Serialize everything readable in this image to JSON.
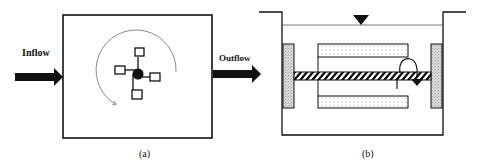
{
  "figure": {
    "panel_a": {
      "caption": "(a)",
      "inflow_label": "Inflow",
      "outflow_label": "Outflow",
      "rotation_direction": "counter-clockwise-arrow",
      "impeller": "four-blade-paddle-icon"
    },
    "panel_b": {
      "caption": "(b)",
      "water_level_marker": "inverted-triangle-icon",
      "components": [
        "tank",
        "end-plates",
        "rotating-shaft",
        "drum-upper",
        "drum-lower",
        "rotation-arrow"
      ]
    }
  },
  "colors": {
    "stroke": "#111111",
    "plate_fill": "#cfcfcf",
    "drum_dots": "#9a9a9a",
    "arc": "#555555"
  }
}
